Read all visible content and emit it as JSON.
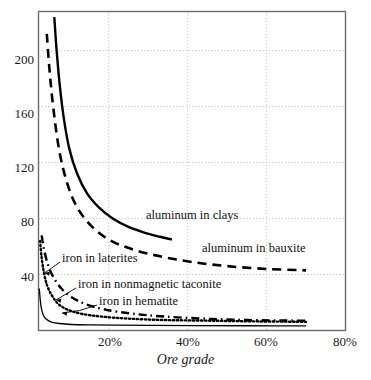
{
  "chart_data": {
    "type": "line",
    "title": "",
    "xlabel": "Ore grade",
    "ylabel": "",
    "xlim": [
      2.2,
      80
    ],
    "ylim": [
      0,
      228
    ],
    "grid": true,
    "legend_position": "inline-labels",
    "x_ticks": [
      "20%",
      "40%",
      "60%",
      "80%"
    ],
    "x_tick_values": [
      20,
      40,
      60,
      80
    ],
    "y_ticks": [
      "40",
      "80",
      "120",
      "160",
      "200"
    ],
    "y_tick_values": [
      40,
      80,
      120,
      160,
      200
    ],
    "series": [
      {
        "name": "aluminum in clays",
        "style": "solid",
        "label": "aluminum in clays",
        "x": [
          6.2,
          6.8,
          7.6,
          8.6,
          10.0,
          12.0,
          14.5,
          17.5,
          21.0,
          25.0,
          29.0,
          33.0,
          36.0
        ],
        "y": [
          224,
          200,
          175,
          152,
          130,
          112,
          98,
          88,
          80,
          74,
          70,
          67,
          65
        ]
      },
      {
        "name": "aluminum in bauxite",
        "style": "dashed",
        "label": "aluminum in bauxite",
        "x": [
          4.3,
          5.0,
          6.0,
          7.5,
          9.5,
          12.0,
          15.5,
          20.0,
          26.0,
          33.0,
          41.0,
          50.0,
          60.0,
          70.0
        ],
        "y": [
          212,
          186,
          158,
          128,
          105,
          88,
          75,
          65,
          58,
          53,
          49,
          46,
          44,
          43
        ]
      },
      {
        "name": "iron in laterites",
        "style": "dash-dot",
        "label": "iron in laterites",
        "x": [
          3.0,
          3.6,
          4.6,
          6.0,
          8.0,
          10.5,
          14.0,
          19.0,
          26.0,
          34.0,
          44.0,
          55.0,
          70.0
        ],
        "y": [
          68,
          58,
          47,
          38,
          30,
          24,
          19,
          15,
          12,
          10,
          8.5,
          7.5,
          7
        ]
      },
      {
        "name": "iron in nonmagnetic taconite",
        "style": "dotted",
        "label": "iron in nonmagnetic taconite",
        "x": [
          2.6,
          3.0,
          3.6,
          4.4,
          5.6,
          7.2,
          9.5,
          13.0,
          18.0,
          25.0,
          34.0,
          46.0,
          58.0,
          70.0
        ],
        "y": [
          64,
          52,
          41,
          32,
          25,
          19,
          15,
          12,
          10,
          8.5,
          7.5,
          7,
          6.5,
          6.2
        ]
      },
      {
        "name": "iron in hematite",
        "style": "thin-solid",
        "label": "iron in hematite",
        "x": [
          2.4,
          2.8,
          3.4,
          4.2,
          5.5,
          7.5,
          10.5,
          15.0,
          22.0,
          31.0,
          42.0,
          55.0,
          70.0
        ],
        "y": [
          30,
          18,
          11,
          8,
          6,
          5,
          4.3,
          4.0,
          3.8,
          3.6,
          3.5,
          3.4,
          3.3
        ]
      }
    ],
    "annotations": [
      {
        "text": "aluminum in clays",
        "x_px": 146,
        "y_px": 215
      },
      {
        "text": "aluminum in bauxite",
        "x_px": 202,
        "y_px": 248
      },
      {
        "text": "iron in laterites",
        "x_px": 62,
        "y_px": 258
      },
      {
        "text": "iron in nonmagnetic taconite",
        "x_px": 78,
        "y_px": 284
      },
      {
        "text": "iron in hematite",
        "x_px": 99,
        "y_px": 301
      }
    ]
  },
  "colors": {
    "line": "#000000",
    "grid": "#b9b9b9",
    "frame": "#6b6b6b",
    "text": "#1a1a1a",
    "background": "#ffffff"
  }
}
